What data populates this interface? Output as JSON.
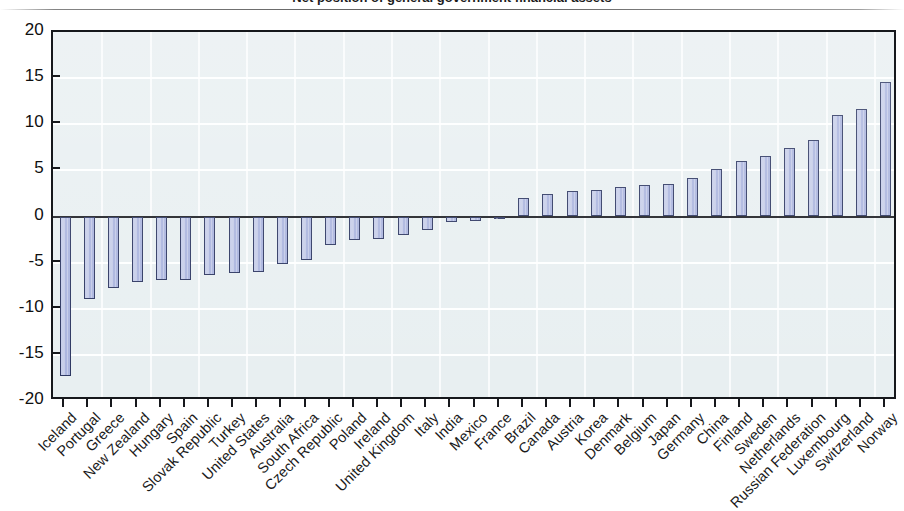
{
  "figure": {
    "title_partial": "Net position of general government financial assets",
    "background_color": "#ffffff",
    "plot_background_color": "#e8eff1",
    "bar_fill_color": "#aab4de",
    "bar_border_color": "#2b3560",
    "axis_color": "#16181c",
    "gridline_color": "#ffffff"
  },
  "chart_data": {
    "type": "bar",
    "title": "",
    "xlabel": "",
    "ylabel": "",
    "ylim": [
      -20,
      20
    ],
    "yticks": [
      20,
      15,
      10,
      5,
      0,
      -5,
      -10,
      -15,
      -20
    ],
    "ytick_labels": [
      "20",
      "15",
      "10",
      "5",
      "0",
      "-5",
      "-10",
      "-15",
      "-20"
    ],
    "grid": true,
    "legend": false,
    "orientation": "vertical",
    "categories": [
      "Iceland",
      "Portugal",
      "Greece",
      "New Zealand",
      "Hungary",
      "Spain",
      "Slovak Republic",
      "Turkey",
      "United States",
      "Australia",
      "South Africa",
      "Czech Republic",
      "Poland",
      "Ireland",
      "United Kingdom",
      "Italy",
      "India",
      "Mexico",
      "France",
      "Brazil",
      "Canada",
      "Austria",
      "Korea",
      "Denmark",
      "Belgium",
      "Japan",
      "Germany",
      "China",
      "Finland",
      "Sweden",
      "Netherlands",
      "Russian Federation",
      "Luxembourg",
      "Switzerland",
      "Norway"
    ],
    "values": [
      -17.3,
      -8.9,
      -7.7,
      -7.1,
      -6.9,
      -6.9,
      -6.3,
      -6.1,
      -6.0,
      -5.2,
      -4.7,
      -3.1,
      -2.6,
      -2.4,
      -2.0,
      -1.5,
      -0.6,
      -0.5,
      -0.3,
      2.0,
      2.4,
      2.8,
      2.9,
      3.2,
      3.4,
      3.5,
      4.2,
      5.2,
      6.0,
      6.6,
      7.4,
      8.3,
      11.0,
      11.7,
      14.6
    ],
    "values_note": "Final category Norway = 15.6",
    "values_full": [
      -17.3,
      -8.9,
      -7.7,
      -7.1,
      -6.9,
      -6.9,
      -6.3,
      -6.1,
      -6.0,
      -5.2,
      -4.7,
      -3.1,
      -2.6,
      -2.4,
      -2.0,
      -1.5,
      -0.6,
      -0.5,
      -0.3,
      2.0,
      2.4,
      2.8,
      2.9,
      3.2,
      3.4,
      3.5,
      4.2,
      5.2,
      6.0,
      6.6,
      7.4,
      8.3,
      11.0,
      11.7,
      14.6,
      15.6
    ]
  }
}
